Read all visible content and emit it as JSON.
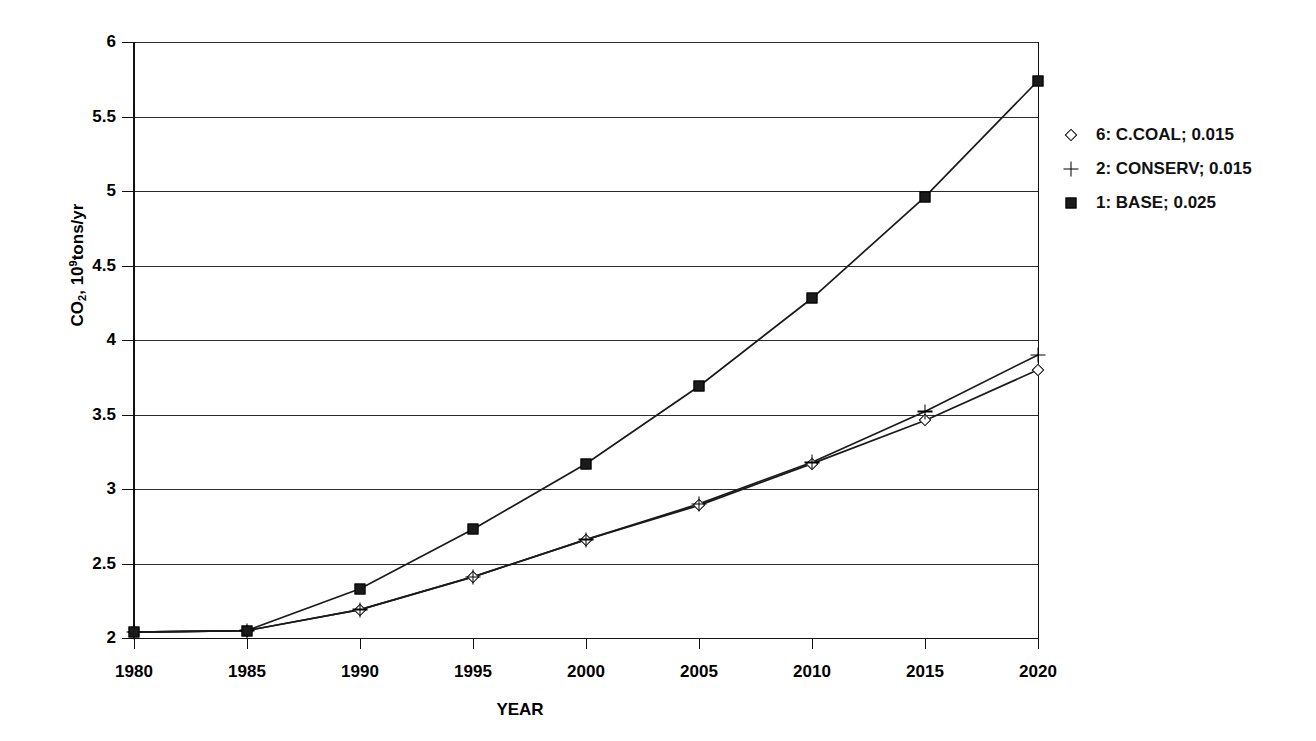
{
  "chart_data": {
    "type": "line",
    "title": "",
    "subtitle": "",
    "xlabel": "YEAR",
    "ylabel": "CO2, 10^9 tons/yr",
    "ylabel_parts": {
      "prefix": "CO",
      "sub": "2",
      "mid": ", 10",
      "sup": "9",
      "suffix": "tons/yr"
    },
    "x": [
      1980,
      1985,
      1990,
      1995,
      2000,
      2005,
      2010,
      2015,
      2020
    ],
    "categories": [
      "1980",
      "1985",
      "1990",
      "1995",
      "2000",
      "2005",
      "2010",
      "2015",
      "2020"
    ],
    "xlim": [
      1980,
      2020
    ],
    "ylim": [
      2,
      6
    ],
    "yticks": [
      2,
      2.5,
      3,
      3.5,
      4,
      4.5,
      5,
      5.5,
      6
    ],
    "ytick_labels": [
      "2",
      "2.5",
      "3",
      "3.5",
      "4",
      "4.5",
      "5",
      "5.5",
      "6"
    ],
    "grid": true,
    "legend_position": "right",
    "series": [
      {
        "name": "6: C.COAL; 0.015",
        "marker": "open-diamond",
        "values": [
          2.04,
          2.05,
          2.19,
          2.41,
          2.66,
          2.89,
          3.17,
          3.46,
          3.8
        ]
      },
      {
        "name": "2: CONSERV; 0.015",
        "marker": "plus",
        "values": [
          2.04,
          2.05,
          2.19,
          2.41,
          2.66,
          2.9,
          3.18,
          3.52,
          3.9
        ]
      },
      {
        "name": "1: BASE; 0.025",
        "marker": "filled-square",
        "values": [
          2.04,
          2.05,
          2.33,
          2.73,
          3.17,
          3.69,
          4.28,
          4.96,
          5.74
        ]
      }
    ]
  },
  "legend": {
    "items": [
      {
        "label": "6: C.COAL; 0.015",
        "marker": "open-diamond"
      },
      {
        "label": "2: CONSERV; 0.015",
        "marker": "plus"
      },
      {
        "label": "1: BASE; 0.025",
        "marker": "filled-square"
      }
    ]
  },
  "colors": {
    "line": "#1a1a1a",
    "grid": "#2b2b2b",
    "axis": "#111111",
    "background": "#ffffff"
  }
}
